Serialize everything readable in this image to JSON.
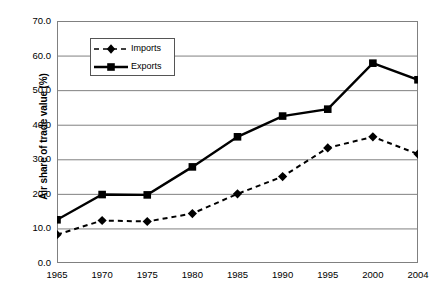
{
  "chart_data": {
    "type": "line",
    "title": "",
    "subtitle": "",
    "xlabel": "",
    "ylabel": "Air share of trade value (%)",
    "categories": [
      "1965",
      "1970",
      "1975",
      "1980",
      "1985",
      "1990",
      "1995",
      "2000",
      "2004"
    ],
    "series": [
      {
        "name": "Imports",
        "marker": "diamond",
        "line_style": "dashed",
        "color": "#000000",
        "values": [
          8.2,
          12.3,
          12.0,
          14.3,
          20.0,
          25.0,
          33.3,
          36.5,
          31.5
        ]
      },
      {
        "name": "Exports",
        "marker": "square",
        "line_style": "solid",
        "color": "#000000",
        "values": [
          12.5,
          19.8,
          19.7,
          27.8,
          36.5,
          42.5,
          44.5,
          57.8,
          53.0
        ]
      }
    ],
    "ylim": [
      0,
      70
    ],
    "ytick_values": [
      0,
      10,
      20,
      30,
      40,
      50,
      60,
      70
    ],
    "ytick_labels": [
      "0.0",
      "10.0",
      "20.0",
      "30.0",
      "40.0",
      "50.0",
      "60.0",
      "70.0"
    ],
    "grid": "horizontal",
    "legend_position": "upper-center-left",
    "legend_entries": [
      "Imports",
      "Exports"
    ],
    "axis_color": "#808080",
    "gridline_color": "#808080",
    "background": "#ffffff"
  }
}
